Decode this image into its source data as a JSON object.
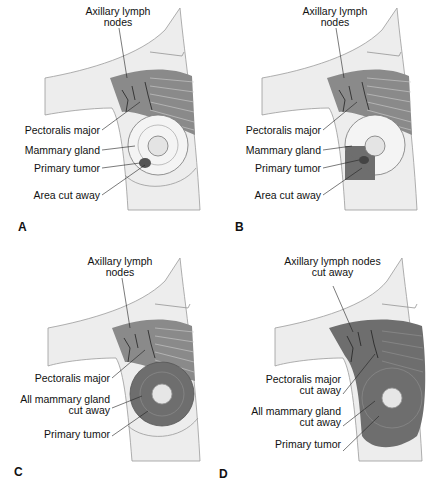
{
  "figure": {
    "panels": [
      {
        "letter": "A",
        "labels": {
          "axillary": "Axillary lymph",
          "axillary2": "nodes",
          "pectoralis": "Pectoralis major",
          "mammary": "Mammary gland",
          "tumor": "Primary tumor",
          "cut": "Area cut away"
        }
      },
      {
        "letter": "B",
        "labels": {
          "axillary": "Axillary lymph",
          "axillary2": "nodes",
          "pectoralis": "Pectoralis major",
          "mammary": "Mammary gland",
          "tumor": "Primary tumor",
          "cut": "Area cut away"
        }
      },
      {
        "letter": "C",
        "labels": {
          "axillary": "Axillary lymph",
          "axillary2": "nodes",
          "pectoralis": "Pectoralis major",
          "mammary": "All mammary gland",
          "mammary2": "cut away",
          "tumor": "Primary tumor"
        }
      },
      {
        "letter": "D",
        "labels": {
          "axillary": "Axillary lymph nodes",
          "axillary2": "cut away",
          "pectoralis": "Pectoralis major",
          "pectoralis2": "cut away",
          "mammary": "All mammary gland",
          "mammary2": "cut away",
          "tumor": "Primary tumor"
        }
      }
    ],
    "colors": {
      "skin": "#ededed",
      "outline": "#9a9a9a",
      "muscle": "#7b7b7b",
      "cut": "#6e6e6e",
      "gland": "#f4f4f4",
      "text": "#111111"
    }
  }
}
